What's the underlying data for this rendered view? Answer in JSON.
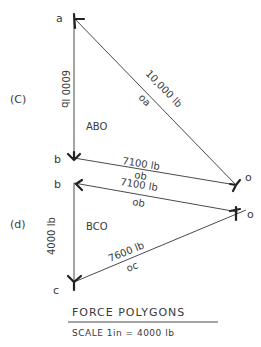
{
  "diagram": {
    "title": "FORCE POLYGONS",
    "scale": "SCALE  1in = 4000 lb",
    "colors": {
      "ink": "#3a3a3a",
      "background": "#ffffff"
    },
    "polygon_c": {
      "section_label": "(C)",
      "region_label": "ABO",
      "points": {
        "a": "a",
        "b": "b",
        "o": "o"
      },
      "edges": [
        {
          "id": "ab",
          "force": "6000 lb",
          "member": "ab"
        },
        {
          "id": "oa",
          "force": "10,000 lb",
          "member": "oa"
        },
        {
          "id": "ob",
          "force": "7100 lb",
          "member": "ob"
        }
      ]
    },
    "polygon_d": {
      "section_label": "(d)",
      "region_label": "BCO",
      "points": {
        "b": "b",
        "c": "c",
        "o": "o"
      },
      "edges": [
        {
          "id": "bc",
          "force": "4000 lb",
          "member": "bc"
        },
        {
          "id": "ob",
          "force": "7100 lb",
          "member": "ob"
        },
        {
          "id": "oc",
          "force": "7600 lb",
          "member": "oc"
        }
      ]
    }
  }
}
